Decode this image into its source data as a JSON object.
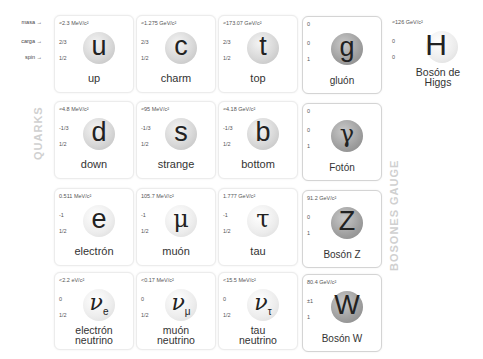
{
  "row_labels": {
    "mass": "masa →",
    "charge": "carga →",
    "spin": "spin →"
  },
  "group_labels": {
    "quarks": "QUARKS",
    "gauge": "BOSONES GAUGE"
  },
  "particles": {
    "up": {
      "mass": "≈2.3 MeV/c²",
      "charge": "2/3",
      "spin": "1/2",
      "symbol": "u",
      "name": "up"
    },
    "charm": {
      "mass": "≈1.275 GeV/c²",
      "charge": "2/3",
      "spin": "1/2",
      "symbol": "c",
      "name": "charm"
    },
    "top": {
      "mass": "≈173.07 GeV/c²",
      "charge": "2/3",
      "spin": "1/2",
      "symbol": "t",
      "name": "top"
    },
    "gluon": {
      "mass": "0",
      "charge": "0",
      "spin": "1",
      "symbol": "g",
      "name": "gluón"
    },
    "higgs": {
      "mass": "≈126 GeV/c²",
      "charge": "0",
      "spin": "0",
      "symbol": "H",
      "name_line1": "Bosón de",
      "name_line2": "Higgs"
    },
    "down": {
      "mass": "≈4.8 MeV/c²",
      "charge": "-1/3",
      "spin": "1/2",
      "symbol": "d",
      "name": "down"
    },
    "strange": {
      "mass": "≈95 MeV/c²",
      "charge": "-1/3",
      "spin": "1/2",
      "symbol": "s",
      "name": "strange"
    },
    "bottom": {
      "mass": "≈4.18 GeV/c²",
      "charge": "-1/3",
      "spin": "1/2",
      "symbol": "b",
      "name": "bottom"
    },
    "photon": {
      "mass": "0",
      "charge": "0",
      "spin": "1",
      "symbol": "γ",
      "name": "Fotón"
    },
    "electron": {
      "mass": "0.511 MeV/c²",
      "charge": "-1",
      "spin": "1/2",
      "symbol": "e",
      "name": "electrón"
    },
    "muon": {
      "mass": "105.7 MeV/c²",
      "charge": "-1",
      "spin": "1/2",
      "symbol": "μ",
      "name": "muón"
    },
    "tau": {
      "mass": "1.777 GeV/c²",
      "charge": "-1",
      "spin": "1/2",
      "symbol": "τ",
      "name": "tau"
    },
    "z": {
      "mass": "91.2 GeV/c²",
      "charge": "0",
      "spin": "1",
      "symbol": "Z",
      "name": "Bosón Z"
    },
    "nu_e": {
      "mass": "<2.2 eV/c²",
      "charge": "0",
      "spin": "1/2",
      "symbol": "ν",
      "sub": "e",
      "name_line1": "electrón",
      "name_line2": "neutrino"
    },
    "nu_mu": {
      "mass": "<0.17 MeV/c²",
      "charge": "0",
      "spin": "1/2",
      "symbol": "ν",
      "sub": "μ",
      "name_line1": "muón",
      "name_line2": "neutrino"
    },
    "nu_tau": {
      "mass": "<15.5 MeV/c²",
      "charge": "0",
      "spin": "1/2",
      "symbol": "ν",
      "sub": "τ",
      "name_line1": "tau",
      "name_line2": "neutrino"
    },
    "w": {
      "mass": "80.4 GeV/c²",
      "charge": "±1",
      "spin": "1",
      "symbol": "W",
      "name": "Bosón W"
    }
  }
}
